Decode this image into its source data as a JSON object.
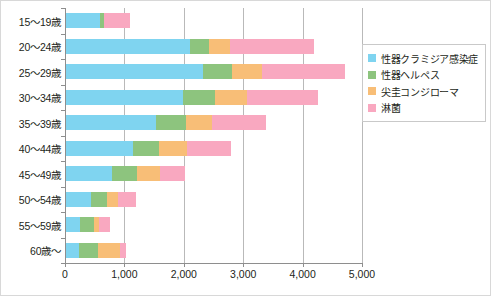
{
  "chart_data": {
    "type": "bar",
    "orientation": "horizontal",
    "stacked": true,
    "title": "",
    "xlabel": "",
    "ylabel": "",
    "xlim": [
      0,
      5000
    ],
    "grid": true,
    "legend_position": "right",
    "categories": [
      "15〜19歳",
      "20〜24歳",
      "25〜29歳",
      "30〜34歳",
      "35〜39歳",
      "40〜44歳",
      "45〜49歳",
      "50〜54歳",
      "55〜59歳",
      "60歳〜"
    ],
    "xticks": [
      0,
      1000,
      2000,
      3000,
      4000,
      5000
    ],
    "xticklabels": [
      "0",
      "1,000",
      "2,000",
      "3,000",
      "4,000",
      "5,000"
    ],
    "series": [
      {
        "name": "性器クラミジア感染症",
        "color": "#7FD4F0",
        "values": [
          590,
          2100,
          2320,
          1980,
          1530,
          1140,
          790,
          440,
          250,
          230
        ]
      },
      {
        "name": "性器ヘルペス",
        "color": "#8DC47E",
        "values": [
          75,
          320,
          490,
          540,
          500,
          450,
          420,
          270,
          230,
          330
        ]
      },
      {
        "name": "尖圭コンジローマ",
        "color": "#F8BE77",
        "values": [
          0,
          350,
          500,
          540,
          440,
          470,
          390,
          180,
          90,
          360
        ]
      },
      {
        "name": "淋菌",
        "color": "#F9A8C0",
        "values": [
          425,
          1430,
          1400,
          1200,
          910,
          740,
          420,
          300,
          190,
          100
        ]
      }
    ],
    "totals": [
      1090,
      4200,
      4710,
      4260,
      3380,
      2800,
      2020,
      1190,
      760,
      1020
    ]
  }
}
